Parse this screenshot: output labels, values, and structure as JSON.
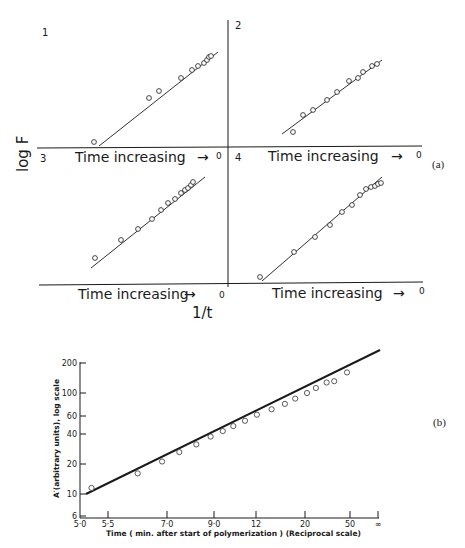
{
  "chart_data": [
    {
      "id": "a",
      "type": "scatter",
      "panel_label": "(a)",
      "ylabel": "log F",
      "xlabel": "1/t",
      "quadrant_axis_label": "Time increasing",
      "quadrant_axis_arrow": "→",
      "quadrant_axis_end": "0",
      "grid": false,
      "panels": [
        {
          "label": "1",
          "points": [
            [
              94,
              142
            ],
            [
              149,
              98
            ],
            [
              159,
              91
            ],
            [
              181,
              78
            ],
            [
              192,
              70
            ],
            [
              198,
              66
            ],
            [
              204,
              63
            ],
            [
              207,
              60
            ],
            [
              209,
              57
            ],
            [
              211,
              56
            ]
          ],
          "line": [
            [
              99,
              146
            ],
            [
              218,
              52
            ]
          ]
        },
        {
          "label": "2",
          "points": [
            [
              293,
              132
            ],
            [
              303,
              115
            ],
            [
              313,
              110
            ],
            [
              327,
              100
            ],
            [
              337,
              92
            ],
            [
              349,
              81
            ],
            [
              358,
              78
            ],
            [
              363,
              72
            ],
            [
              372,
              66
            ],
            [
              377,
              64
            ]
          ],
          "line": [
            [
              282,
              134
            ],
            [
              382,
              60
            ]
          ]
        },
        {
          "label": "3",
          "points": [
            [
              95,
              258
            ],
            [
              121,
              240
            ],
            [
              138,
              229
            ],
            [
              152,
              219
            ],
            [
              161,
              210
            ],
            [
              168,
              203
            ],
            [
              175,
              199
            ],
            [
              181,
              193
            ],
            [
              185,
              190
            ],
            [
              188,
              188
            ],
            [
              191,
              185
            ],
            [
              193,
              182
            ]
          ],
          "line": [
            [
              91,
              268
            ],
            [
              205,
              177
            ]
          ]
        },
        {
          "label": "4",
          "points": [
            [
              260,
              277
            ],
            [
              294,
              252
            ],
            [
              315,
              237
            ],
            [
              330,
              225
            ],
            [
              342,
              212
            ],
            [
              352,
              205
            ],
            [
              360,
              195
            ],
            [
              366,
              189
            ],
            [
              371,
              187
            ],
            [
              375,
              186
            ],
            [
              378,
              184
            ],
            [
              381,
              183
            ]
          ],
          "line": [
            [
              262,
              281
            ],
            [
              382,
              177
            ]
          ]
        }
      ]
    },
    {
      "id": "b",
      "type": "scatter",
      "panel_label": "(b)",
      "title": "",
      "xlabel": "Time ( min. after start of polymerization ) (Reciprocal scale)",
      "ylabel": "A′(arbitrary units), log scale",
      "y_ticks": [
        "200",
        "100",
        "60",
        "40",
        "20",
        "10",
        "6"
      ],
      "x_ticks": [
        "5·0",
        "5·5",
        "7·0",
        "9·0",
        "12",
        "20",
        "50",
        "∞"
      ],
      "ylim": [
        6,
        200
      ],
      "x_scale": "reciprocal",
      "y_scale": "log",
      "grid": false,
      "fit_line": {
        "x": [
          5.1,
          "∞"
        ],
        "y": [
          10,
          240
        ]
      },
      "points": [
        {
          "x": 5.2,
          "y": 11.5
        },
        {
          "x": 6.2,
          "y": 16
        },
        {
          "x": 6.9,
          "y": 21
        },
        {
          "x": 7.5,
          "y": 26
        },
        {
          "x": 8.2,
          "y": 31
        },
        {
          "x": 8.9,
          "y": 37
        },
        {
          "x": 9.6,
          "y": 42
        },
        {
          "x": 10.3,
          "y": 47
        },
        {
          "x": 11.2,
          "y": 53
        },
        {
          "x": 12.3,
          "y": 61
        },
        {
          "x": 14,
          "y": 69
        },
        {
          "x": 16,
          "y": 78
        },
        {
          "x": 18,
          "y": 88
        },
        {
          "x": 21,
          "y": 100
        },
        {
          "x": 24,
          "y": 112
        },
        {
          "x": 29,
          "y": 127
        },
        {
          "x": 34,
          "y": 131
        },
        {
          "x": 48,
          "y": 160
        }
      ]
    }
  ],
  "figure_a": {
    "ylabel": "log F",
    "xlabel": "1/t",
    "panel_label": "(a)",
    "quadrants": [
      {
        "number": "1",
        "axis_text": "Time increasing",
        "arrow": "→",
        "zero": "0"
      },
      {
        "number": "2",
        "axis_text": "Time increasing",
        "arrow": "→",
        "zero": "0"
      },
      {
        "number": "3",
        "axis_text": "Time increasing",
        "arrow": "→",
        "zero": "0"
      },
      {
        "number": "4",
        "axis_text": "Time increasing",
        "arrow": "→",
        "zero": "0"
      }
    ]
  },
  "figure_b": {
    "panel_label": "(b)",
    "ylabel": "A′(arbitrary units), log scale",
    "xlabel": "Time ( min. after start of polymerization ) (Reciprocal scale)",
    "y_ticks": [
      {
        "label": "200",
        "y": 363
      },
      {
        "label": "100",
        "y": 393
      },
      {
        "label": "60",
        "y": 416
      },
      {
        "label": "40",
        "y": 434
      },
      {
        "label": "20",
        "y": 464
      },
      {
        "label": "10",
        "y": 494
      },
      {
        "label": "6",
        "y": 516
      }
    ],
    "x_ticks": [
      {
        "label": "5·0",
        "x": 80
      },
      {
        "label": "5·5",
        "x": 108
      },
      {
        "label": "7·0",
        "x": 167
      },
      {
        "label": "9·0",
        "x": 214
      },
      {
        "label": "12",
        "x": 256
      },
      {
        "label": "20",
        "x": 305
      },
      {
        "label": "50",
        "x": 350
      },
      {
        "label": "∞",
        "x": 378
      }
    ]
  }
}
